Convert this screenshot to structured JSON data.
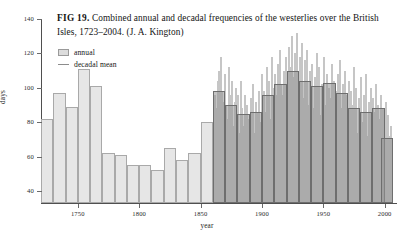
{
  "caption": {
    "fig_label": "FIG 19.",
    "text": "Combined annual and decadal frequencies of the westerlies over the British Isles, 1723–2004. (J. A. Kington)"
  },
  "legend": {
    "position": "top-left-inside",
    "items": [
      {
        "label": "annual",
        "marker": "filled-box",
        "color": "#dcdcdc"
      },
      {
        "label": "decadal mean",
        "marker": "line",
        "color": "#8c8c8c"
      }
    ]
  },
  "colors": {
    "annual_bar": "#d9d9d9",
    "decadal_bar": "#969696",
    "decadal_outline": "#6e6e6e",
    "axis": "#4f4f4f",
    "background": "#ffffff",
    "text": "#1a1a1a"
  },
  "chart_data": {
    "type": "bar",
    "title": "Combined annual and decadal frequencies of the westerlies over the British Isles, 1723–2004. (J. A. Kington)",
    "xlabel": "year",
    "ylabel": "days",
    "xlim": [
      1720,
      2010
    ],
    "ylim": [
      33,
      140
    ],
    "ytick_values": [
      40,
      60,
      80,
      100,
      120,
      140
    ],
    "ytick_labels": [
      "40",
      "60",
      "80",
      "100",
      "120",
      "140"
    ],
    "xtick_values": [
      1750,
      1800,
      1850,
      1900,
      1950,
      2000
    ],
    "xtick_labels": [
      "1750",
      "1800",
      "1850",
      "1900",
      "1950",
      "2000"
    ],
    "grid": false,
    "series": [
      {
        "name": "decadal mean",
        "type": "bar",
        "bar_width_years": 10,
        "x": [
          1725,
          1735,
          1745,
          1755,
          1765,
          1775,
          1785,
          1795,
          1805,
          1815,
          1825,
          1835,
          1845,
          1855,
          1865,
          1875,
          1885,
          1895,
          1905,
          1915,
          1925,
          1935,
          1945,
          1955,
          1965,
          1975,
          1985,
          1995,
          2002
        ],
        "values": [
          82,
          97,
          89,
          111,
          101,
          62,
          61,
          55,
          55,
          52,
          65,
          58,
          62,
          80,
          98,
          90,
          85,
          86,
          96,
          102,
          110,
          104,
          101,
          103,
          97,
          88,
          86,
          88,
          71
        ]
      },
      {
        "name": "annual",
        "type": "bar",
        "bar_width_years": 1,
        "start_year": 1861,
        "end_year": 2004,
        "values": [
          96,
          88,
          104,
          110,
          86,
          118,
          98,
          92,
          108,
          90,
          82,
          112,
          96,
          86,
          104,
          78,
          92,
          100,
          84,
          96,
          74,
          104,
          88,
          78,
          96,
          70,
          90,
          82,
          76,
          94,
          88,
          102,
          74,
          92,
          66,
          86,
          98,
          80,
          108,
          90,
          98,
          86,
          112,
          94,
          104,
          82,
          118,
          100,
          90,
          108,
          96,
          114,
          88,
          122,
          102,
          96,
          110,
          86,
          118,
          104,
          124,
          98,
          112,
          130,
          106,
          120,
          96,
          132,
          110,
          118,
          102,
          126,
          94,
          116,
          104,
          122,
          90,
          110,
          98,
          114,
          88,
          106,
          100,
          120,
          92,
          112,
          84,
          102,
          96,
          118,
          90,
          108,
          82,
          100,
          94,
          114,
          86,
          104,
          76,
          98,
          108,
          92,
          116,
          88,
          102,
          80,
          110,
          96,
          86,
          104,
          78,
          98,
          90,
          112,
          84,
          100,
          74,
          94,
          86,
          106,
          80,
          96,
          88,
          108,
          72,
          92,
          84,
          100,
          78,
          94,
          86,
          102,
          70,
          90,
          82,
          96,
          74,
          88,
          80,
          92,
          66,
          84,
          72,
          78
        ]
      }
    ]
  }
}
